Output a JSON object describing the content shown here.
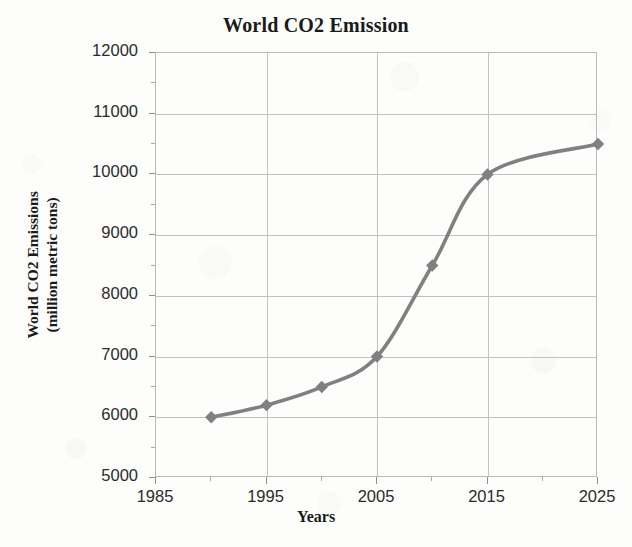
{
  "chart_data": {
    "type": "line",
    "title": "World CO2 Emission",
    "xlabel": "Years",
    "ylabel": "World CO2 Emissions\n(million metric tons)",
    "ylabel_line1": "World CO2 Emissions",
    "ylabel_line2": "(million metric tons)",
    "xlim": [
      1985,
      2025
    ],
    "ylim": [
      5000,
      12000
    ],
    "grid": true,
    "legend": "none",
    "line_color": "#808080",
    "marker": "diamond",
    "marker_color": "#808080",
    "x": [
      1990,
      1995,
      2000,
      2005,
      2010,
      2015,
      2025
    ],
    "values": [
      6000,
      6200,
      6500,
      7000,
      8500,
      10000,
      10500
    ],
    "series": [
      {
        "name": "World CO2 Emissions",
        "points": [
          {
            "x": 1990,
            "y": 6000
          },
          {
            "x": 1995,
            "y": 6200
          },
          {
            "x": 2000,
            "y": 6500
          },
          {
            "x": 2005,
            "y": 7000
          },
          {
            "x": 2010,
            "y": 8500
          },
          {
            "x": 2015,
            "y": 10000
          },
          {
            "x": 2025,
            "y": 10500
          }
        ]
      }
    ],
    "yticks": [
      12000,
      11000,
      10000,
      9000,
      8000,
      7000,
      6000,
      5000
    ],
    "ytick_labels": [
      "12000",
      "11000",
      "10000",
      "9000",
      "8000",
      "7000",
      "6000",
      "5000"
    ],
    "xticks": [
      1985,
      1995,
      2005,
      2015,
      2025
    ],
    "xtick_labels": [
      "1985",
      "1995",
      "2005",
      "2015",
      "2025"
    ],
    "xticks_minor": [
      1990,
      2000,
      2010,
      2020
    ],
    "yticks_minor": [
      11500,
      10500,
      9500,
      8500,
      7500,
      6500,
      5500
    ]
  },
  "colors": {
    "background": "#fdfdfb",
    "grid": "#c2c2c2",
    "axis": "#b9b9b9",
    "text": "#1a1a1a",
    "tick_text": "#2b2b2b",
    "series": "#808080"
  }
}
